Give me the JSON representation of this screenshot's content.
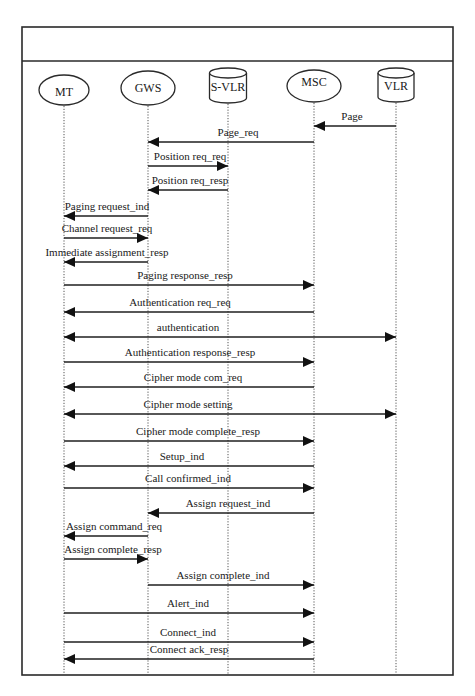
{
  "diagram": {
    "type": "sequence",
    "frame": {
      "x": 22,
      "y": 27,
      "width": 431,
      "height": 648,
      "header_divider_y": 61,
      "header_label": ""
    },
    "actors": [
      {
        "id": "MT",
        "label": "MT",
        "shape": "ellipse",
        "x": 64,
        "cy": 90,
        "rx": 25,
        "ry": 15,
        "label_dy": 4
      },
      {
        "id": "GWS",
        "label": "GWS",
        "shape": "ellipse",
        "x": 148,
        "cy": 88,
        "rx": 27,
        "ry": 17,
        "label_dy": 2
      },
      {
        "id": "S-VLR",
        "label": "S-VLR",
        "shape": "cylinder",
        "x": 228,
        "top": 68,
        "width": 37,
        "height": 35
      },
      {
        "id": "MSC",
        "label": "MSC",
        "shape": "ellipse",
        "x": 314,
        "cy": 86,
        "rx": 27,
        "ry": 16,
        "label_dy": -2
      },
      {
        "id": "VLR",
        "label": "VLR",
        "shape": "cylinder",
        "x": 396,
        "top": 68,
        "width": 36,
        "height": 34
      }
    ],
    "lifeline_bottom": 675,
    "messages": [
      {
        "label": "Page",
        "from": "VLR",
        "to": "MSC",
        "y": 126,
        "label_x": 352,
        "direction": "left"
      },
      {
        "label": "Page_req",
        "from": "MSC",
        "to": "GWS",
        "y": 142,
        "label_x": 238,
        "direction": "left"
      },
      {
        "label": "Position req_req",
        "from": "GWS",
        "to": "S-VLR",
        "y": 166,
        "label_x": 190,
        "direction": "right"
      },
      {
        "label": "Position req_resp",
        "from": "S-VLR",
        "to": "GWS",
        "y": 190,
        "label_x": 190,
        "direction": "left"
      },
      {
        "label": "Paging request_ind",
        "from": "GWS",
        "to": "MT",
        "y": 216,
        "label_x": 107,
        "direction": "left"
      },
      {
        "label": "Channel request_req",
        "from": "MT",
        "to": "GWS",
        "y": 238,
        "label_x": 107,
        "direction": "right"
      },
      {
        "label": "Immediate assignment_resp",
        "from": "GWS",
        "to": "MT",
        "y": 262,
        "label_x": 107,
        "direction": "left"
      },
      {
        "label": "Paging response_resp",
        "from": "MT",
        "to": "MSC",
        "y": 285,
        "label_x": 185,
        "direction": "right"
      },
      {
        "label": "Authentication req_req",
        "from": "MSC",
        "to": "MT",
        "y": 312,
        "label_x": 180,
        "direction": "left"
      },
      {
        "label": "authentication",
        "from": "MT",
        "to": "VLR",
        "y": 337,
        "label_x": 188,
        "direction": "both"
      },
      {
        "label": "Authentication response_resp",
        "from": "MT",
        "to": "MSC",
        "y": 362,
        "label_x": 190,
        "direction": "right"
      },
      {
        "label": "Cipher mode com_req",
        "from": "MSC",
        "to": "MT",
        "y": 387,
        "label_x": 193,
        "direction": "left"
      },
      {
        "label": "Cipher mode setting",
        "from": "MT",
        "to": "VLR",
        "y": 414,
        "label_x": 188,
        "direction": "both"
      },
      {
        "label": "Cipher mode complete_resp",
        "from": "MT",
        "to": "MSC",
        "y": 441,
        "label_x": 198,
        "direction": "right"
      },
      {
        "label": "Setup_ind",
        "from": "MSC",
        "to": "MT",
        "y": 466,
        "label_x": 182,
        "direction": "left"
      },
      {
        "label": "Call confirmed_ind",
        "from": "MT",
        "to": "MSC",
        "y": 488,
        "label_x": 188,
        "direction": "right"
      },
      {
        "label": "Assign request_ind",
        "from": "MSC",
        "to": "GWS",
        "y": 513,
        "label_x": 228,
        "direction": "left"
      },
      {
        "label": "Assign command_req",
        "from": "GWS",
        "to": "MT",
        "y": 536,
        "label_x": 114,
        "direction": "left"
      },
      {
        "label": "Assign complete_resp",
        "from": "MT",
        "to": "GWS",
        "y": 559,
        "label_x": 113,
        "direction": "right"
      },
      {
        "label": "Assign complete_ind",
        "from": "GWS",
        "to": "MSC",
        "y": 585,
        "label_x": 223,
        "direction": "right"
      },
      {
        "label": "Alert_ind",
        "from": "MT",
        "to": "MSC",
        "y": 613,
        "label_x": 188,
        "direction": "right"
      },
      {
        "label": "Connect_ind",
        "from": "MT",
        "to": "MSC",
        "y": 642,
        "label_x": 188,
        "direction": "right"
      },
      {
        "label": "Connect ack_resp",
        "from": "MSC",
        "to": "MT",
        "y": 659,
        "label_x": 189,
        "direction": "left"
      }
    ]
  }
}
